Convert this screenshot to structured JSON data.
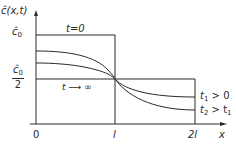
{
  "diagram": {
    "y_axis_label": "ĉ(x,t)",
    "x_axis_label": "x",
    "y_ticks": {
      "c0": "ĉ",
      "c0_sub": "0",
      "half_num": "ĉ",
      "half_num_sub": "0",
      "half_den": "2"
    },
    "x_ticks": [
      "0",
      "l",
      "2l"
    ],
    "curve_labels": {
      "initial": "t=0",
      "steady": "t ⟶ ∞",
      "t1": "t",
      "t1_sub": "1",
      "t1_rest": " > 0",
      "t2": "t",
      "t2_sub": "2",
      "t2_rest": " > t",
      "t2_rest_sub": "1"
    },
    "colors": {
      "line": "#2a2a2a",
      "background": "#ffffff"
    }
  }
}
